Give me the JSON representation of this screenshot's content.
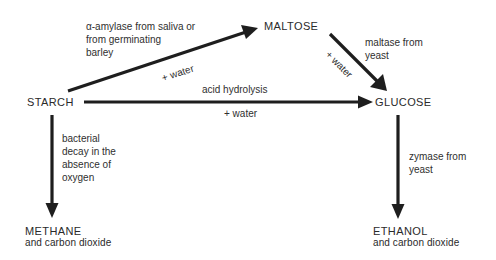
{
  "diagram": {
    "nodes": {
      "starch": {
        "label": "STARCH"
      },
      "maltose": {
        "label": "MALTOSE"
      },
      "glucose": {
        "label": "GLUCOSE"
      },
      "methane": {
        "label": "METHANE",
        "sub": "and carbon dioxide"
      },
      "ethanol": {
        "label": "ETHANOL",
        "sub": "and carbon dioxide"
      }
    },
    "edges": {
      "starch_to_maltose": {
        "from": "STARCH",
        "to": "MALTOSE",
        "label_lines": [
          "α-amylase from saliva or",
          "from germinating",
          "barley"
        ],
        "condition": "+ water"
      },
      "starch_to_glucose": {
        "from": "STARCH",
        "to": "GLUCOSE",
        "label": "acid hydrolysis",
        "condition": "+ water"
      },
      "maltose_to_glucose": {
        "from": "MALTOSE",
        "to": "GLUCOSE",
        "label_lines": [
          "maltase from",
          "yeast"
        ],
        "condition": "+ water"
      },
      "starch_to_methane": {
        "from": "STARCH",
        "to": "METHANE",
        "label_lines": [
          "bacterial",
          "decay in the",
          "absence of",
          "oxygen"
        ]
      },
      "glucose_to_ethanol": {
        "from": "GLUCOSE",
        "to": "ETHANOL",
        "label_lines": [
          "zymase from",
          "yeast"
        ]
      }
    },
    "colors": {
      "arrow": "#1e1e1e",
      "text": "#2a2a2a",
      "background": "#ffffff"
    }
  }
}
